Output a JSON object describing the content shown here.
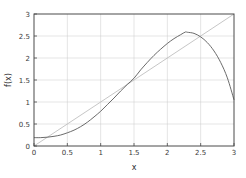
{
  "chart_data": {
    "type": "line",
    "title": "",
    "xlabel": "x",
    "ylabel": "f(x)",
    "xlim": [
      0,
      3
    ],
    "ylim": [
      0,
      3
    ],
    "grid": true,
    "legend": "none",
    "xticks": [
      0,
      0.5,
      1,
      1.5,
      2,
      2.5,
      3
    ],
    "xtick_labels": [
      "0",
      "0.5",
      "1",
      "1.5",
      "2",
      "2.5",
      "3"
    ],
    "yticks": [
      0,
      0.5,
      1,
      1.5,
      2,
      2.5,
      3
    ],
    "ytick_labels": [
      "0",
      "0.5",
      "1",
      "1.5",
      "2",
      "2.5",
      "3"
    ],
    "series": [
      {
        "name": "f(x)",
        "color": "#5a5a5a",
        "style": "solid",
        "x": [
          0,
          0.1,
          0.2,
          0.3,
          0.4,
          0.5,
          0.6,
          0.7,
          0.8,
          0.9,
          1,
          1.1,
          1.2,
          1.3,
          1.4,
          1.5,
          1.6,
          1.7,
          1.8,
          1.9,
          2,
          2.1,
          2.2,
          2.27,
          2.3,
          2.4,
          2.5,
          2.6,
          2.7,
          2.8,
          2.9,
          3
        ],
        "values": [
          0.19,
          0.19,
          0.2,
          0.22,
          0.25,
          0.3,
          0.36,
          0.44,
          0.54,
          0.66,
          0.79,
          0.94,
          1.09,
          1.25,
          1.4,
          1.54,
          1.73,
          1.9,
          2.06,
          2.2,
          2.33,
          2.44,
          2.53,
          2.59,
          2.585,
          2.56,
          2.48,
          2.35,
          2.16,
          1.9,
          1.55,
          1.05
        ]
      },
      {
        "name": "y = x",
        "color": "#c0c0c0",
        "style": "solid",
        "x": [
          0,
          3
        ],
        "values": [
          0,
          3
        ]
      }
    ],
    "annotations": {
      "peak_x": 2.27,
      "peak_y": 2.59,
      "start_y": 0.19,
      "end_y": 1.05,
      "crossing_x": 1.5,
      "crossing_y": 1.5
    },
    "colors": {
      "curve": "#5a5a5a",
      "reference_line": "#c0c0c0",
      "grid": "#c8c8c8",
      "frame": "#4a4a4a",
      "text": "#3a3a3a",
      "background": "#ffffff"
    }
  }
}
